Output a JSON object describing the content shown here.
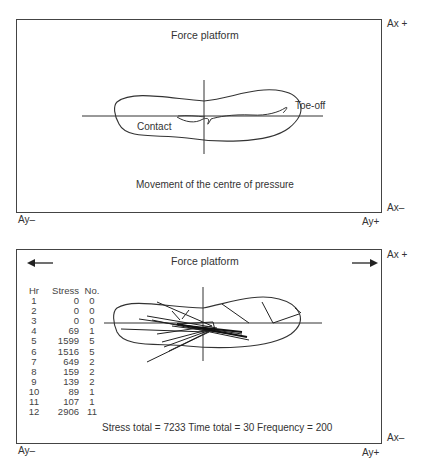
{
  "top_panel": {
    "title": "Force platform",
    "label_toe_off": "Toe-off",
    "label_contact": "Contact",
    "caption": "Movement of the centre of pressure"
  },
  "bottom_panel": {
    "title": "Force platform",
    "table": {
      "headers": [
        "Hr",
        "Stress",
        "No."
      ],
      "rows": [
        [
          "1",
          "0",
          "0"
        ],
        [
          "2",
          "0",
          "0"
        ],
        [
          "3",
          "0",
          "0"
        ],
        [
          "4",
          "69",
          "1"
        ],
        [
          "5",
          "1599",
          "5"
        ],
        [
          "6",
          "1516",
          "5"
        ],
        [
          "7",
          "649",
          "2"
        ],
        [
          "8",
          "159",
          "2"
        ],
        [
          "9",
          "139",
          "2"
        ],
        [
          "10",
          "89",
          "1"
        ],
        [
          "11",
          "107",
          "1"
        ],
        [
          "12",
          "2906",
          "11"
        ]
      ]
    },
    "summary": "Stress total = 7233  Time total = 30  Frequency = 200",
    "icons": [
      "arrow-left-icon",
      "arrow-right-icon"
    ]
  },
  "axes": {
    "ax_plus": "Ax +",
    "ax_minus": "Ax–",
    "ay_minus": "Ay–",
    "ay_plus": "Ay+"
  }
}
